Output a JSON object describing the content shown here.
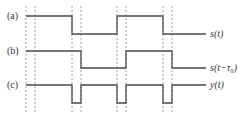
{
  "diagram": {
    "type": "timing-diagram",
    "panels": [
      {
        "id": "a",
        "label": "(a)",
        "signal_label": "s(t)",
        "description": "square wave starting high",
        "levels": {
          "high": 16,
          "low": 34
        },
        "transitions_x": [
          72,
          117,
          163
        ]
      },
      {
        "id": "b",
        "label": "(b)",
        "signal_label": "s(t−τ₀)",
        "description": "square wave delayed by tau0",
        "levels": {
          "high": 51,
          "low": 68
        },
        "transitions_x": [
          81,
          126,
          172
        ]
      },
      {
        "id": "c",
        "label": "(c)",
        "signal_label": "y(t)",
        "description": "product signal with short negative dips during delay intervals",
        "levels": {
          "high": 85,
          "low": 103
        },
        "dips": [
          [
            72,
            81
          ],
          [
            117,
            126
          ],
          [
            163,
            172
          ]
        ]
      }
    ],
    "dashed_guides_x": [
      26,
      35,
      72,
      81,
      117,
      126,
      163,
      172
    ],
    "colors": {
      "wave": "#4a4a4a",
      "guide": "#8a8a8a",
      "text": "#333333"
    }
  }
}
